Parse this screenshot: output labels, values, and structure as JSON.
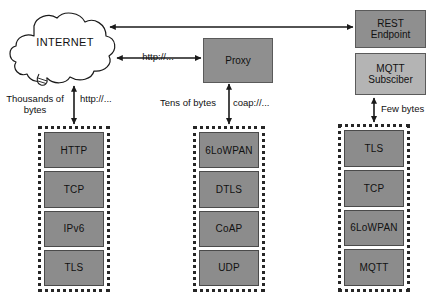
{
  "diagram": {
    "cloud": {
      "label": "INTERNET",
      "icon": "cloud-icon"
    },
    "nodes": {
      "proxy": {
        "label": "Proxy"
      },
      "rest_endpoint": {
        "label": "REST\nEndpoint"
      },
      "mqtt_subscriber": {
        "label": "MQTT\nSubsciber"
      }
    },
    "edge_labels": {
      "thousands_of_bytes": "Thousands of\nbytes",
      "http_left": "http://...",
      "http_proxy": "http://...",
      "tens_of_bytes": "Tens of bytes",
      "coap": "coap://...",
      "few_bytes": "Few bytes"
    },
    "stacks": [
      {
        "id": "http-stack",
        "layers": [
          "HTTP",
          "TCP",
          "IPv6",
          "TLS"
        ]
      },
      {
        "id": "coap-stack",
        "layers": [
          "6LoWPAN",
          "DTLS",
          "CoAP",
          "UDP"
        ]
      },
      {
        "id": "mqtt-stack",
        "layers": [
          "TLS",
          "TCP",
          "6LoWPAN",
          "MQTT"
        ]
      }
    ],
    "colors": {
      "layer_fill": "#8c8c8c",
      "box_dark": "#8f8f8f",
      "box_light": "#b4b4b4",
      "stroke": "#262626",
      "background": "#ffffff"
    }
  }
}
